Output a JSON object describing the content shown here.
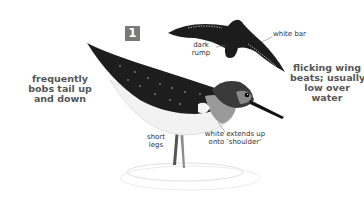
{
  "plate": {
    "number": "1",
    "badge_color": "#7a7a7a"
  },
  "labels": {
    "tail": [
      "frequently",
      "bobs tail up",
      "and down"
    ],
    "flight": [
      "flicking wing",
      "beats; usually",
      "low over",
      "water"
    ],
    "rump": [
      "dark",
      "rump"
    ],
    "wing_bar": "white bar",
    "legs": [
      "short",
      "legs"
    ],
    "shoulder": [
      "white extends up",
      "onto ‘shoulder’"
    ]
  },
  "illustrations": {
    "standing_bird": "sandpiper-standing",
    "flying_bird": "sandpiper-flying"
  }
}
